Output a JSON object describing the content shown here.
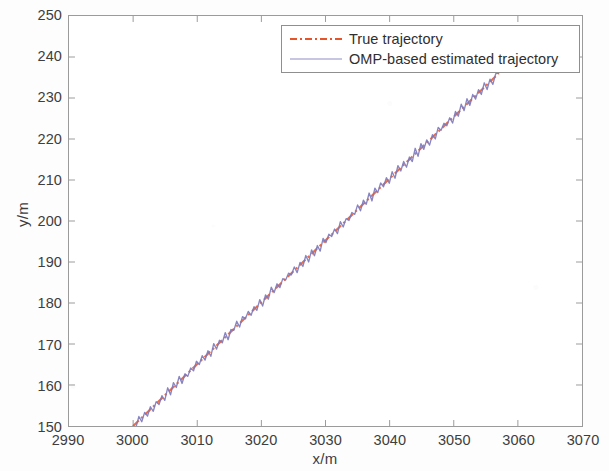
{
  "chart_data": {
    "type": "line",
    "title": "",
    "xlabel": "x/m",
    "ylabel": "y/m",
    "xlim": [
      2990,
      3070
    ],
    "ylim": [
      150,
      250
    ],
    "xticks": [
      2990,
      3000,
      3010,
      3020,
      3030,
      3040,
      3050,
      3060,
      3070
    ],
    "yticks": [
      150,
      160,
      170,
      180,
      190,
      200,
      210,
      220,
      230,
      240,
      250
    ],
    "xtick_labels": [
      "2990",
      "3000",
      "3010",
      "3020",
      "3030",
      "3040",
      "3050",
      "3060",
      "3070"
    ],
    "ytick_labels": [
      "150",
      "160",
      "170",
      "180",
      "190",
      "200",
      "210",
      "220",
      "230",
      "240",
      "250"
    ],
    "grid": false,
    "box": true,
    "legend_position": "top-right-inside",
    "series": [
      {
        "name": "True trajectory",
        "color": "#e8542a",
        "linestyle": "dash-dot",
        "x": [
          3000,
          3002,
          3004,
          3006,
          3008,
          3010,
          3012,
          3014,
          3016,
          3018,
          3020,
          3022,
          3024,
          3026,
          3028,
          3030,
          3032,
          3034,
          3036,
          3038,
          3040,
          3042,
          3044,
          3046,
          3048,
          3050,
          3052,
          3054,
          3056,
          3057
        ],
        "y": [
          150.0,
          153.0,
          156.0,
          159.0,
          162.0,
          165.0,
          168.0,
          171.0,
          174.0,
          177.0,
          180.1,
          183.1,
          186.1,
          189.1,
          192.1,
          195.1,
          198.1,
          201.1,
          204.1,
          207.1,
          210.2,
          213.2,
          216.2,
          219.2,
          222.2,
          225.2,
          228.2,
          231.2,
          234.2,
          235.7
        ]
      },
      {
        "name": "OMP-based estimated trajectory",
        "color": "#7a79bc",
        "linestyle": "solid",
        "note": "noisy estimate zig-zagging about the true trajectory",
        "x": [
          3000,
          3002,
          3004,
          3006,
          3008,
          3010,
          3012,
          3014,
          3016,
          3018,
          3020,
          3022,
          3024,
          3026,
          3028,
          3030,
          3032,
          3034,
          3036,
          3038,
          3040,
          3042,
          3044,
          3046,
          3048,
          3050,
          3052,
          3054,
          3056,
          3057
        ],
        "y": [
          150.1,
          152.6,
          156.5,
          158.7,
          162.4,
          164.6,
          168.4,
          170.7,
          174.5,
          176.6,
          180.5,
          182.7,
          186.6,
          188.8,
          192.5,
          194.7,
          198.6,
          200.8,
          204.5,
          206.8,
          210.6,
          212.9,
          216.7,
          218.9,
          222.6,
          224.9,
          228.7,
          230.9,
          234.5,
          235.8
        ]
      }
    ],
    "trajectory_endpoints": {
      "start": [
        3000,
        150
      ],
      "end": [
        3057,
        236
      ]
    },
    "noise_amplitude_m": 1.2,
    "noise_period_m": 0.9
  },
  "legend": {
    "entries": [
      {
        "label": "True trajectory"
      },
      {
        "label": "OMP-based estimated trajectory"
      }
    ]
  },
  "axes": {
    "x_title": "x/m",
    "y_title": "y/m"
  },
  "colors": {
    "true_trajectory": "#e8542a",
    "estimated_trajectory": "#7a79bc",
    "axis": "#9b9b9b",
    "text": "#3e3e3e",
    "background": "#ffffff"
  }
}
